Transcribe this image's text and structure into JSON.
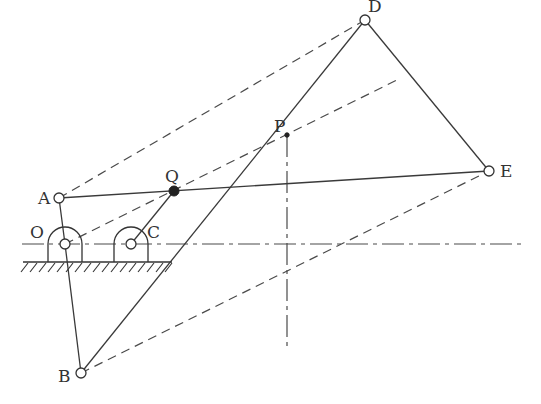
{
  "diagram": {
    "type": "linkage-mechanism",
    "labels": {
      "A": "A",
      "B": "B",
      "C": "C",
      "D": "D",
      "E": "E",
      "O": "O",
      "P": "P",
      "Q": "Q"
    },
    "points": {
      "O": [
        65,
        244
      ],
      "C": [
        131,
        244
      ],
      "A": [
        59,
        198
      ],
      "Q": [
        174,
        191
      ],
      "B": [
        81,
        373
      ],
      "D": [
        365,
        20
      ],
      "E": [
        489,
        171
      ],
      "P": [
        287,
        135
      ]
    },
    "solid_links": [
      "O-A-B",
      "A-Q-E",
      "C-Q",
      "B-P-D",
      "D-E"
    ],
    "dashed_lines": [
      "A-D",
      "O-Q-DE",
      "B-E"
    ],
    "centerlines": [
      "horizontal through O and C",
      "vertical through P"
    ],
    "colors": {
      "line": "#3a3a3a",
      "background": "#ffffff"
    }
  }
}
